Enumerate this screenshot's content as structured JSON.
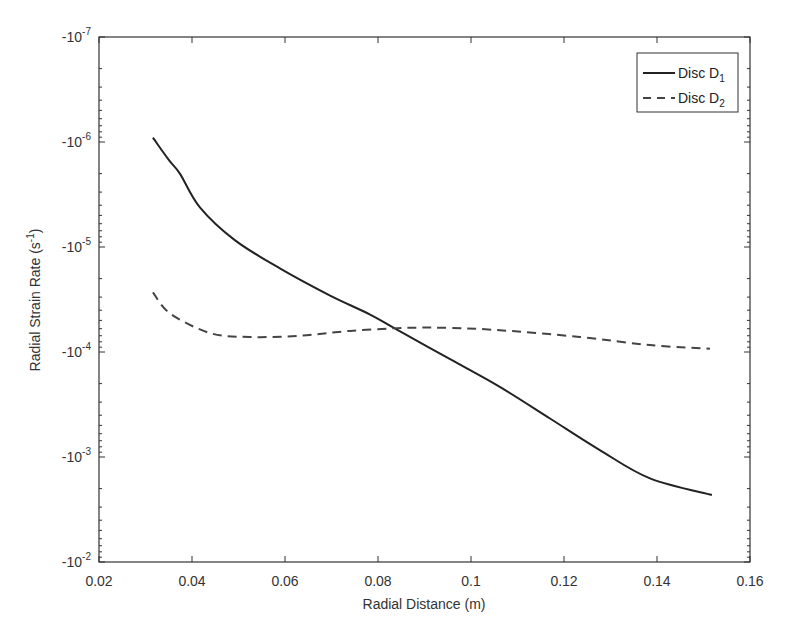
{
  "chart_data": {
    "type": "line",
    "title": "",
    "xlabel": "Radial Distance (m)",
    "ylabel_main": "Radial Strain Rate (s",
    "ylabel_sup": "-1",
    "ylabel_close": ")",
    "xlim": [
      0.02,
      0.16
    ],
    "ylim": [
      -1e-07,
      -0.01
    ],
    "yscale": "log (negative values)",
    "x_ticks": [
      "0.02",
      "0.04",
      "0.06",
      "0.08",
      "0.1",
      "0.12",
      "0.14",
      "0.16"
    ],
    "y_ticks": [
      {
        "base": "-10",
        "exp": "-7"
      },
      {
        "base": "-10",
        "exp": "-6"
      },
      {
        "base": "-10",
        "exp": "-5"
      },
      {
        "base": "-10",
        "exp": "-4"
      },
      {
        "base": "-10",
        "exp": "-3"
      },
      {
        "base": "-10",
        "exp": "-2"
      }
    ],
    "grid": false,
    "legend_position": "upper right",
    "series": [
      {
        "name": "Disc D1",
        "label_main": "Disc D",
        "label_sub": "1",
        "style": "solid",
        "color": "#222222",
        "x": [
          0.0316,
          0.035,
          0.0374,
          0.0417,
          0.0492,
          0.0589,
          0.0697,
          0.0783,
          0.0837,
          0.0955,
          0.1062,
          0.117,
          0.1277,
          0.1385,
          0.1518
        ],
        "values": [
          -9.1e-07,
          -1.48e-06,
          -2e-06,
          -4.2e-06,
          -8.6e-06,
          -1.6e-05,
          -2.9e-05,
          -4.4e-05,
          -6e-05,
          -0.000117,
          -0.000215,
          -0.00043,
          -0.00086,
          -0.0016,
          -0.0023
        ]
      },
      {
        "name": "Disc D2",
        "label_main": "Disc D",
        "label_sub": "2",
        "style": "dashed",
        "color": "#444444",
        "x": [
          0.0316,
          0.0353,
          0.0439,
          0.0525,
          0.0632,
          0.074,
          0.0858,
          0.0955,
          0.1062,
          0.1234,
          0.1385,
          0.1514
        ],
        "values": [
          -2.7e-05,
          -4.3e-05,
          -6.6e-05,
          -7.2e-05,
          -7e-05,
          -6.3e-05,
          -5.9e-05,
          -5.9e-05,
          -6.2e-05,
          -7.2e-05,
          -8.6e-05,
          -9.3e-05
        ]
      }
    ]
  }
}
